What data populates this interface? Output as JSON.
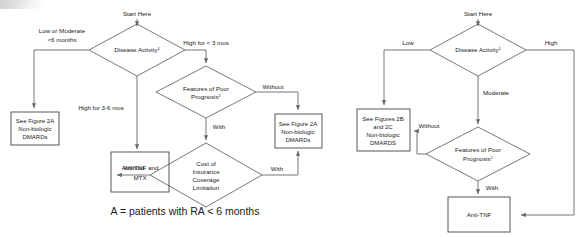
{
  "figure": {
    "caption": "A = patients with RA < 6 months",
    "superscript_marker": "1"
  },
  "charts": [
    {
      "id": "panel-a",
      "start_label": "Start Here",
      "nodes": [
        {
          "id": "a-disease-activity",
          "type": "decision",
          "lines": [
            "Disease Activity"
          ],
          "superscript": "1"
        },
        {
          "id": "a-poor-prognosis",
          "type": "decision",
          "lines": [
            "Features of Poor",
            "Prognosis"
          ],
          "superscript": "1"
        },
        {
          "id": "a-cost-limitation",
          "type": "decision",
          "lines": [
            "Cost of",
            "Insurance",
            "Coverage",
            "Limitation"
          ],
          "superscript": ""
        },
        {
          "id": "a-see-fig-2a-left",
          "type": "process",
          "lines": [
            "See Figure 2A",
            "Non-biologic",
            "DMARDs"
          ]
        },
        {
          "id": "a-anti-tnf-mtx",
          "type": "process",
          "lines": [
            "Anti-TNF and",
            "MTX"
          ]
        },
        {
          "id": "a-see-fig-2a-right",
          "type": "process",
          "lines": [
            "See Figure 2A",
            "Non-biologic",
            "DMARDs"
          ]
        }
      ],
      "edges": [
        {
          "id": "a-edge-low-moderate",
          "from": "a-disease-activity",
          "to": "a-see-fig-2a-left",
          "label": "Low or Moderate\n<6 months",
          "label_lines": [
            "Low or Moderate",
            "<6 months"
          ]
        },
        {
          "id": "a-edge-high-lt3",
          "from": "a-disease-activity",
          "to": "a-poor-prognosis",
          "label_lines": [
            "High for < 3 mos"
          ]
        },
        {
          "id": "a-edge-high-3to6",
          "from": "a-disease-activity",
          "to": "a-anti-tnf-mtx",
          "label_lines": [
            "High for 3-6 mos"
          ]
        },
        {
          "id": "a-edge-without-prognosis",
          "from": "a-poor-prognosis",
          "to": "a-see-fig-2a-right",
          "label_lines": [
            "Without"
          ]
        },
        {
          "id": "a-edge-with-prognosis",
          "from": "a-poor-prognosis",
          "to": "a-cost-limitation",
          "label_lines": [
            "With"
          ]
        },
        {
          "id": "a-edge-without-cost",
          "from": "a-cost-limitation",
          "to": "a-anti-tnf-mtx",
          "label_lines": [
            "Without"
          ]
        },
        {
          "id": "a-edge-with-cost",
          "from": "a-cost-limitation",
          "to": "a-see-fig-2a-right",
          "label_lines": [
            "With"
          ]
        }
      ]
    },
    {
      "id": "panel-b",
      "start_label": "Start Here",
      "nodes": [
        {
          "id": "b-disease-activity",
          "type": "decision",
          "lines": [
            "Disease Activity"
          ],
          "superscript": "1"
        },
        {
          "id": "b-poor-prognosis",
          "type": "decision",
          "lines": [
            "Features of Poor",
            "Prognosis"
          ],
          "superscript": "1"
        },
        {
          "id": "b-see-fig-2b-2c",
          "type": "process",
          "lines": [
            "See Figures 2B",
            "and 2C",
            "Non-biologic",
            "DMARDS"
          ]
        },
        {
          "id": "b-anti-tnf",
          "type": "process",
          "lines": [
            "Anti-TNF"
          ]
        }
      ],
      "edges": [
        {
          "id": "b-edge-low",
          "from": "b-disease-activity",
          "to": "b-see-fig-2b-2c",
          "label_lines": [
            "Low"
          ]
        },
        {
          "id": "b-edge-high",
          "from": "b-disease-activity",
          "to": "b-anti-tnf",
          "label_lines": [
            "High"
          ]
        },
        {
          "id": "b-edge-moderate",
          "from": "b-disease-activity",
          "to": "b-poor-prognosis",
          "label_lines": [
            "Moderate"
          ]
        },
        {
          "id": "b-edge-without",
          "from": "b-poor-prognosis",
          "to": "b-see-fig-2b-2c",
          "label_lines": [
            "Without"
          ]
        },
        {
          "id": "b-edge-with",
          "from": "b-poor-prognosis",
          "to": "b-anti-tnf",
          "label_lines": [
            "With"
          ]
        }
      ]
    }
  ]
}
